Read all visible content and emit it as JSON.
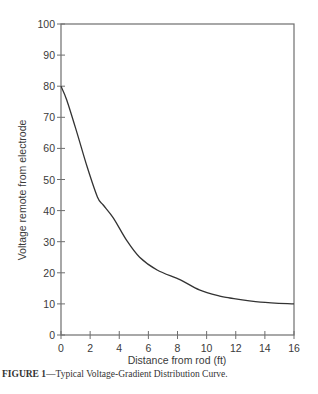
{
  "chart_data": {
    "type": "line",
    "title": "",
    "xlabel": "Distance from rod (ft)",
    "ylabel": "Voltage remote from electrode",
    "xlim": [
      0,
      16
    ],
    "ylim": [
      0,
      100
    ],
    "x_ticks": [
      0,
      2,
      4,
      6,
      8,
      10,
      12,
      14,
      16
    ],
    "y_ticks": [
      0,
      10,
      20,
      30,
      40,
      50,
      60,
      70,
      80,
      90,
      100
    ],
    "grid": false,
    "legend": null,
    "series": [
      {
        "name": "Voltage-gradient distribution",
        "x": [
          0,
          0.4,
          1.1,
          1.8,
          2.5,
          2.9,
          3.6,
          4.5,
          5.4,
          6.6,
          8.2,
          9.5,
          10.9,
          11.6,
          13.7,
          16
        ],
        "y": [
          80,
          75.5,
          65,
          54,
          44.4,
          41.8,
          37.6,
          30.5,
          25,
          20.9,
          17.7,
          14.5,
          12.5,
          11.9,
          10.6,
          10
        ]
      }
    ],
    "caption": {
      "label": "FIGURE 1",
      "text": "—Typical Voltage-Gradient Distribution Curve."
    }
  },
  "colors": {
    "axis": "#6e6e6e",
    "curve": "#333333",
    "text": "#3a3a3a"
  }
}
